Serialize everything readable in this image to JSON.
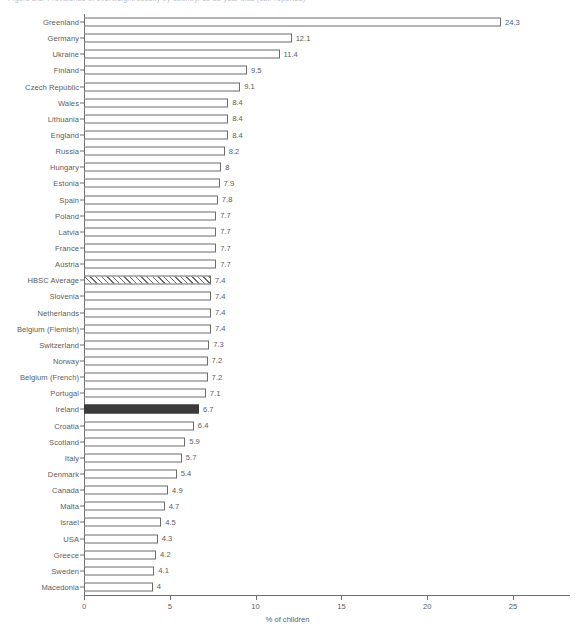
{
  "figure": {
    "title": "Figure 2.6: Prevalence of overweight/obesity by country, 11-15 year olds (self-reported)"
  },
  "chart_data": {
    "type": "bar",
    "orientation": "horizontal",
    "title": "",
    "xlabel": "% of children",
    "ylabel": "",
    "xlim": [
      0,
      25
    ],
    "xticks": [
      0,
      5,
      10,
      15,
      20,
      25
    ],
    "xtick_labels": [
      "0",
      "5",
      "10",
      "15",
      "20",
      "25"
    ],
    "grid": false,
    "legend": null,
    "highlight_colors": {
      "default": "#ffffff",
      "default_edge": "#6b6b6b",
      "average_hatched": "#ffffff",
      "highlight_filled": "#3b3b3b"
    },
    "categories": [
      "Greenland",
      "Germany",
      "Ukraine",
      "Finland",
      "Czech Republic",
      "Wales",
      "Lithuania",
      "England",
      "Russia",
      "Hungary",
      "Estonia",
      "Spain",
      "Poland",
      "Latvia",
      "France",
      "Austria",
      "HBSC Average",
      "Slovenia",
      "Netherlands",
      "Belgium (Flemish)",
      "Switzerland",
      "Norway",
      "Belgium (French)",
      "Portugal",
      "Ireland",
      "Croatia",
      "Scotland",
      "Italy",
      "Denmark",
      "Canada",
      "Malta",
      "Israel",
      "USA",
      "Greece",
      "Sweden",
      "Macedonia"
    ],
    "values": [
      24.3,
      12.1,
      11.4,
      9.5,
      9.1,
      8.4,
      8.4,
      8.4,
      8.2,
      8,
      7.9,
      7.8,
      7.7,
      7.7,
      7.7,
      7.7,
      7.4,
      7.4,
      7.4,
      7.4,
      7.3,
      7.2,
      7.2,
      7.1,
      6.7,
      6.4,
      5.9,
      5.7,
      5.4,
      4.9,
      4.7,
      4.5,
      4.3,
      4.2,
      4.1,
      4
    ],
    "value_labels": [
      "24.3",
      "12.1",
      "11.4",
      "9.5",
      "9.1",
      "8.4",
      "8.4",
      "8.4",
      "8.2",
      "8",
      "7.9",
      "7.8",
      "7.7",
      "7.7",
      "7.7",
      "7.7",
      "7.4",
      "7.4",
      "7.4",
      "7.4",
      "7.3",
      "7.2",
      "7.2",
      "7.1",
      "6.7",
      "6.4",
      "5.9",
      "5.7",
      "5.4",
      "4.9",
      "4.7",
      "4.5",
      "4.3",
      "4.2",
      "4.1",
      "4"
    ],
    "styles": [
      "open",
      "open",
      "open",
      "open",
      "open",
      "open",
      "open",
      "open",
      "open",
      "open",
      "open",
      "open",
      "open",
      "open",
      "open",
      "open",
      "hatched",
      "open",
      "open",
      "open",
      "open",
      "open",
      "open",
      "open",
      "filled",
      "open",
      "open",
      "open",
      "open",
      "open",
      "open",
      "open",
      "open",
      "open",
      "open",
      "open"
    ]
  }
}
